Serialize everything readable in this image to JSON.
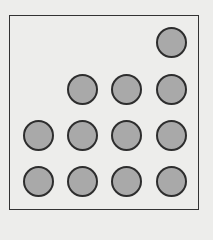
{
  "diagram": {
    "rows": [
      {
        "count": 1,
        "columns": [
          4
        ]
      },
      {
        "count": 3,
        "columns": [
          2,
          3,
          4
        ]
      },
      {
        "count": 4,
        "columns": [
          1,
          2,
          3,
          4
        ]
      },
      {
        "count": 4,
        "columns": [
          1,
          2,
          3,
          4
        ]
      }
    ],
    "total_dots": 12,
    "dot_color": "#a9a9a9",
    "outline_color": "#2d2d2d"
  }
}
